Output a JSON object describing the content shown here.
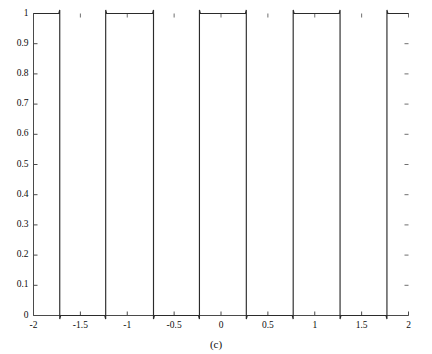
{
  "figure": {
    "caption": "(c)",
    "background_color": "#ffffff",
    "line_color": "#2b2b2b",
    "axis_color": "#4a4a4a"
  },
  "chart_data": {
    "type": "line",
    "title": "",
    "subtitle": "",
    "xlabel": "",
    "ylabel": "",
    "xlim": [
      -2,
      2
    ],
    "ylim": [
      0,
      1
    ],
    "grid": false,
    "legend": null,
    "xticks": [
      -2,
      -1.5,
      -1,
      -0.5,
      0,
      0.5,
      1,
      1.5,
      2
    ],
    "xticklabels": [
      "-2",
      "-1.5",
      "-1",
      "-0.5",
      "0",
      "0.5",
      "1",
      "1.5",
      "2"
    ],
    "yticks": [
      0,
      0.1,
      0.2,
      0.3,
      0.4,
      0.5,
      0.6,
      0.7,
      0.8,
      0.9,
      1
    ],
    "yticklabels": [
      "0",
      "0.1",
      "0.2",
      "0.3",
      "0.4",
      "0.5",
      "0.6",
      "0.7",
      "0.8",
      "0.9",
      "1"
    ],
    "series": [
      {
        "name": "square-wave",
        "period": 1.0,
        "low_value": 0.0,
        "high_value": 1.0,
        "transitions": [
          -1.72,
          -1.23,
          -0.72,
          -0.23,
          0.27,
          0.77,
          1.27,
          1.77
        ],
        "segments": [
          {
            "x_start": -2.0,
            "x_end": -1.72,
            "level": 1.0
          },
          {
            "x_start": -1.72,
            "x_end": -1.23,
            "level": 0.0
          },
          {
            "x_start": -1.23,
            "x_end": -0.72,
            "level": 1.0
          },
          {
            "x_start": -0.72,
            "x_end": -0.23,
            "level": 0.0
          },
          {
            "x_start": -0.23,
            "x_end": 0.27,
            "level": 1.0
          },
          {
            "x_start": 0.27,
            "x_end": 0.77,
            "level": 0.0
          },
          {
            "x_start": 0.77,
            "x_end": 1.27,
            "level": 1.0
          },
          {
            "x_start": 1.27,
            "x_end": 1.77,
            "level": 0.0
          },
          {
            "x_start": 1.77,
            "x_end": 2.0,
            "level": 1.0
          }
        ]
      }
    ]
  }
}
